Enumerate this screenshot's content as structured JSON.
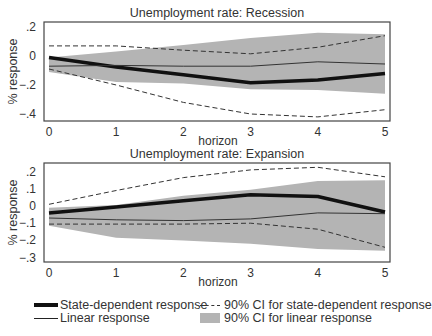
{
  "chart_data": [
    {
      "type": "line",
      "title": "Unemployment rate: Recession",
      "xlabel": "horizon",
      "ylabel": "% response",
      "x": [
        0,
        1,
        2,
        3,
        4,
        5
      ],
      "x_ticks": [
        "0",
        "1",
        "2",
        "3",
        "4",
        "5"
      ],
      "y_ticks": [
        {
          "value": 0.2,
          "label": ".2"
        },
        {
          "value": 0.0,
          "label": "0"
        },
        {
          "value": -0.2,
          "label": "-.2"
        },
        {
          "value": -0.4,
          "label": "-.4"
        }
      ],
      "ylim": [
        -0.45,
        0.23
      ],
      "grid": false,
      "series": [
        {
          "name": "State-dependent response",
          "style": "thick",
          "values": [
            -0.01,
            -0.075,
            -0.13,
            -0.185,
            -0.165,
            -0.12
          ]
        },
        {
          "name": "Linear response",
          "style": "thin",
          "values": [
            -0.07,
            -0.065,
            -0.07,
            -0.07,
            -0.04,
            -0.055
          ]
        },
        {
          "name": "90% CI for state-dependent response (upper)",
          "style": "dashed",
          "values": [
            0.07,
            0.07,
            0.04,
            0.015,
            0.06,
            0.14
          ]
        },
        {
          "name": "90% CI for state-dependent response (lower)",
          "style": "dashed",
          "values": [
            -0.09,
            -0.2,
            -0.32,
            -0.4,
            -0.42,
            -0.37
          ]
        }
      ],
      "band": {
        "name": "90% CI for linear response",
        "upper": [
          -0.01,
          0.03,
          0.075,
          0.125,
          0.16,
          0.15
        ],
        "lower": [
          -0.11,
          -0.18,
          -0.19,
          -0.23,
          -0.235,
          -0.26
        ]
      },
      "frame": {
        "left": 44,
        "right": 390,
        "top": 22,
        "bottom": 121,
        "x0": 49,
        "x5": 385,
        "y_zero": 56,
        "px_per_unit": 145
      }
    },
    {
      "type": "line",
      "title": "Unemployment rate: Expansion",
      "xlabel": "horizon",
      "ylabel": "% response",
      "x": [
        0,
        1,
        2,
        3,
        4,
        5
      ],
      "x_ticks": [
        "0",
        "1",
        "2",
        "3",
        "4",
        "5"
      ],
      "y_ticks": [
        {
          "value": 0.2,
          "label": ".2"
        },
        {
          "value": 0.1,
          "label": ".1"
        },
        {
          "value": 0.0,
          "label": "0"
        },
        {
          "value": -0.1,
          "label": "-.1"
        },
        {
          "value": -0.2,
          "label": "-.2"
        },
        {
          "value": -0.3,
          "label": "-.3"
        }
      ],
      "ylim": [
        -0.326,
        0.25
      ],
      "grid": false,
      "series": [
        {
          "name": "State-dependent response",
          "style": "thick",
          "values": [
            -0.04,
            -0.005,
            0.03,
            0.065,
            0.055,
            -0.035
          ]
        },
        {
          "name": "Linear response",
          "style": "thin",
          "values": [
            -0.07,
            -0.08,
            -0.085,
            -0.075,
            -0.04,
            -0.045
          ]
        },
        {
          "name": "90% CI for state-dependent response (upper)",
          "style": "dashed",
          "values": [
            0.01,
            0.09,
            0.165,
            0.21,
            0.225,
            0.17
          ]
        },
        {
          "name": "90% CI for state-dependent response (lower)",
          "style": "dashed",
          "values": [
            -0.105,
            -0.105,
            -0.105,
            -0.1,
            -0.135,
            -0.24
          ]
        }
      ],
      "band": {
        "name": "90% CI for linear response",
        "upper": [
          -0.01,
          0.005,
          0.06,
          0.095,
          0.145,
          0.15
        ],
        "lower": [
          -0.115,
          -0.185,
          -0.2,
          -0.22,
          -0.25,
          -0.26
        ]
      },
      "frame": {
        "left": 44,
        "right": 390,
        "top": 163,
        "bottom": 262,
        "x0": 49,
        "x5": 385,
        "y_zero": 206,
        "px_per_unit": 172
      }
    }
  ],
  "legend": {
    "position": "bottom",
    "items": [
      {
        "label": "State-dependent response",
        "symbol": "thick-line"
      },
      {
        "label": "90% CI for state-dependent response",
        "symbol": "dashed-line"
      },
      {
        "label": "Linear response",
        "symbol": "thin-line"
      },
      {
        "label": "90% CI for linear response",
        "symbol": "gray-band"
      }
    ]
  },
  "colors": {
    "band": "#b4b4b4",
    "thick_line": "#111111",
    "thin_line": "#333333",
    "dashed_line": "#333333",
    "frame": "#444444",
    "text": "#333333"
  }
}
